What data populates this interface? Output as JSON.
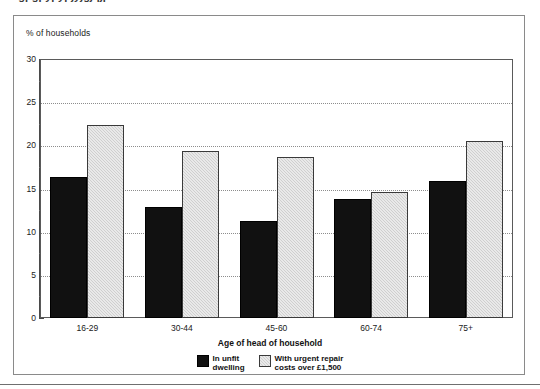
{
  "figure": {
    "clipped_title": "aaagpgpypypjyjgjqjp",
    "axis_note_label": "% of households"
  },
  "chart_data": {
    "type": "bar",
    "title": "",
    "xlabel": "Age of head of household",
    "ylabel": "% of households",
    "categories": [
      "16-29",
      "30-44",
      "45-60",
      "60-74",
      "75+"
    ],
    "series": [
      {
        "name": "In unfit dwelling",
        "legend_label": "In unfit\ndwelling",
        "color": "#111111",
        "values": [
          16.3,
          12.9,
          11.2,
          13.8,
          15.9
        ]
      },
      {
        "name": "With urgent repair costs over £1,500",
        "legend_label": "With urgent repair\ncosts over £1,500",
        "color": "#cfcfcf",
        "values": [
          22.4,
          19.4,
          18.7,
          14.6,
          20.5
        ]
      }
    ],
    "ylim": [
      0,
      30
    ],
    "ytick_major": [
      0,
      5,
      10,
      15,
      20,
      25,
      30
    ],
    "ytick_labels": [
      "0",
      "5",
      "10",
      "15",
      "20",
      "25",
      "30"
    ],
    "ytick_minor_step": 2.5,
    "grid": "horizontal-dotted",
    "legend_position": "bottom-center"
  }
}
